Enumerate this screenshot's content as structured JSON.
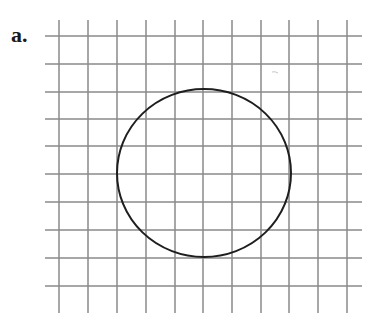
{
  "figure": {
    "label": "a.",
    "top_text_partial": "",
    "grid": {
      "vertical_x": [
        59,
        88,
        117,
        146,
        175,
        203,
        232,
        261,
        289,
        318,
        347
      ],
      "vertical_y_range": [
        20,
        313
      ],
      "horizontal_y": [
        36,
        64,
        92,
        119,
        146,
        174,
        202,
        230,
        258,
        286
      ],
      "horizontal_x_range": [
        45,
        362
      ],
      "line_color": "#8a8a8a",
      "line_width": 1.5
    },
    "circle": {
      "cx": 204,
      "cy": 173,
      "rx": 87,
      "ry": 84,
      "stroke": "#1e1e1e",
      "stroke_width": 2
    },
    "smudge": {
      "x": 272,
      "y": 72
    }
  }
}
